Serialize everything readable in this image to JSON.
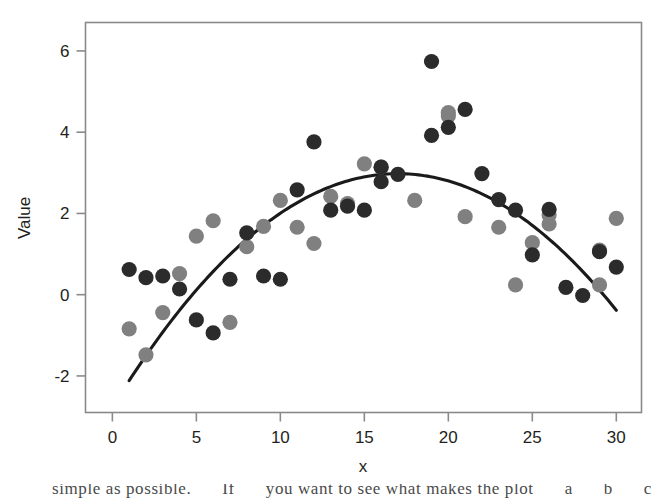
{
  "figure": {
    "name": "scatter-plot-with-quadratic-fit",
    "background_color": "#ffffff",
    "frame_color": "#8a8a8a"
  },
  "axes": {
    "x": {
      "label": "x",
      "ticks": [
        0,
        5,
        10,
        15,
        20,
        25,
        30
      ],
      "tick_labels": [
        "0",
        "5",
        "10",
        "15",
        "20",
        "25",
        "30"
      ],
      "range": [
        -1.6,
        31.5
      ]
    },
    "y": {
      "label": "Value",
      "ticks": [
        -2,
        0,
        2,
        4,
        6
      ],
      "tick_labels": [
        "-2",
        "0",
        "2",
        "4",
        "6"
      ],
      "range": [
        -2.9,
        6.7
      ]
    }
  },
  "colors": {
    "series_dark": "#2b2b2b",
    "series_gray": "#808080",
    "fit_line": "#1a1a1a",
    "axis": "#8a8a8a",
    "text": "#231f20"
  },
  "page_bleed": {
    "line_fragments": [
      "simple as possible.",
      "If",
      "you want to see what makes the plot",
      "a",
      "b",
      "c"
    ],
    "visible_text": "simple as possible. If you want to see what makes the plot"
  },
  "chart_data": {
    "type": "scatter",
    "title": "",
    "xlabel": "x",
    "ylabel": "Value",
    "xlim": [
      -1.6,
      31.5
    ],
    "ylim": [
      -2.9,
      6.7
    ],
    "grid": false,
    "legend": "none",
    "series": [
      {
        "name": "dark-points",
        "color": "#2b2b2b",
        "marker": "filled-circle",
        "points": [
          [
            1,
            0.62
          ],
          [
            2,
            0.42
          ],
          [
            3,
            0.46
          ],
          [
            4,
            0.14
          ],
          [
            5,
            -0.62
          ],
          [
            6,
            -0.94
          ],
          [
            7,
            0.38
          ],
          [
            8,
            1.52
          ],
          [
            9,
            0.46
          ],
          [
            10,
            0.38
          ],
          [
            11,
            2.58
          ],
          [
            12,
            3.76
          ],
          [
            13,
            2.08
          ],
          [
            14,
            2.18
          ],
          [
            15,
            2.08
          ],
          [
            16,
            3.14
          ],
          [
            16,
            2.78
          ],
          [
            17,
            2.96
          ],
          [
            19,
            5.74
          ],
          [
            19,
            3.92
          ],
          [
            20,
            4.12
          ],
          [
            21,
            4.56
          ],
          [
            22,
            2.98
          ],
          [
            23,
            2.34
          ],
          [
            24,
            2.08
          ],
          [
            25,
            0.98
          ],
          [
            26,
            2.1
          ],
          [
            27,
            0.18
          ],
          [
            28,
            -0.02
          ],
          [
            29,
            1.06
          ],
          [
            30,
            0.68
          ]
        ]
      },
      {
        "name": "gray-points",
        "color": "#808080",
        "marker": "filled-circle",
        "points": [
          [
            1,
            -0.84
          ],
          [
            2,
            -1.48
          ],
          [
            3,
            -0.44
          ],
          [
            4,
            0.52
          ],
          [
            5,
            1.44
          ],
          [
            6,
            1.82
          ],
          [
            7,
            -0.68
          ],
          [
            8,
            1.18
          ],
          [
            9,
            1.68
          ],
          [
            10,
            2.32
          ],
          [
            11,
            1.66
          ],
          [
            12,
            1.26
          ],
          [
            13,
            2.42
          ],
          [
            14,
            2.24
          ],
          [
            15,
            3.22
          ],
          [
            16,
            3.14
          ],
          [
            18,
            2.32
          ],
          [
            20,
            4.4
          ],
          [
            20,
            4.48
          ],
          [
            21,
            1.92
          ],
          [
            23,
            1.66
          ],
          [
            24,
            0.24
          ],
          [
            25,
            1.28
          ],
          [
            26,
            1.74
          ],
          [
            26,
            1.96
          ],
          [
            29,
            1.1
          ],
          [
            29,
            0.24
          ],
          [
            30,
            1.88
          ]
        ]
      }
    ],
    "fit_curve": {
      "name": "quadratic-fit",
      "type": "quadratic",
      "color": "#1a1a1a",
      "x_start": 1,
      "x_end": 30,
      "vertex_x": 17,
      "vertex_y": 2.98,
      "y_at_x_start": -1.16,
      "y_at_x_end": 0.38,
      "equation_a": -0.0199,
      "equation_b": 0.6766,
      "equation_c": -2.7715
    }
  }
}
